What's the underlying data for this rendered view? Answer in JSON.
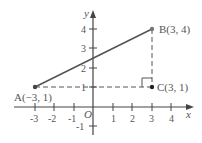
{
  "diagram": {
    "axes": {
      "x_label": "x",
      "y_label": "y",
      "origin_label": "O"
    },
    "x_ticks": [
      "-3",
      "-2",
      "-1",
      "1",
      "2",
      "3",
      "4"
    ],
    "y_ticks": [
      "-1",
      "1",
      "2",
      "3",
      "4"
    ],
    "points": {
      "A": {
        "label": "A(−3, 1)",
        "x": -3,
        "y": 1
      },
      "B": {
        "label": "B(3, 4)",
        "x": 3,
        "y": 4
      },
      "C": {
        "label": "C(3, 1)",
        "x": 3,
        "y": 1
      }
    },
    "segments": [
      {
        "from": "A",
        "to": "B",
        "style": "solid"
      },
      {
        "from": "A",
        "to": "C",
        "style": "dashed"
      },
      {
        "from": "B",
        "to": "C",
        "style": "dashed"
      }
    ],
    "right_angle_at": "C",
    "colors": {
      "axis": "#444444",
      "segment": "#555555",
      "point": "#333333"
    }
  }
}
